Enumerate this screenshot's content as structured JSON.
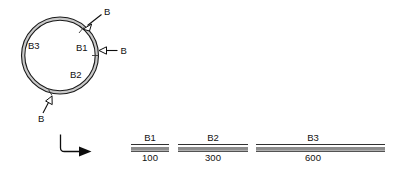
{
  "figure": {
    "panels": {
      "top_label": "circular-plasmid-map",
      "bottom_label": "linear-fragment-ladder"
    }
  },
  "plasmid": {
    "shape": "circle",
    "segment_labels": [
      {
        "id": "b1",
        "text": "B1"
      },
      {
        "id": "b2",
        "text": "B2"
      },
      {
        "id": "b3",
        "text": "B3"
      }
    ],
    "cut_sites": [
      {
        "id": "cut-top-right",
        "text": "B",
        "direction": "down-left"
      },
      {
        "id": "cut-right",
        "text": "B",
        "direction": "left"
      },
      {
        "id": "cut-bottom",
        "text": "B",
        "direction": "up-right"
      }
    ]
  },
  "flow": {
    "arrow_label": "digestion-arrow"
  },
  "fragments": {
    "items": [
      {
        "id": "frag-b1",
        "name": "B1",
        "size": "100"
      },
      {
        "id": "frag-b2",
        "name": "B2",
        "size": "300"
      },
      {
        "id": "frag-b3",
        "name": "B3",
        "size": "600"
      }
    ]
  },
  "colors": {
    "ink": "#111111",
    "ring_fill": "#c9c9c9",
    "background": "#ffffff"
  }
}
